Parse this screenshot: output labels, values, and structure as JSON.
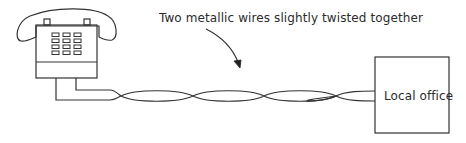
{
  "diagram": {
    "caption": "Two metallic wires slightly twisted together",
    "office_label": "Local office",
    "nodes": [
      {
        "id": "telephone",
        "icon": "telephone-icon"
      },
      {
        "id": "local-office",
        "label": "Local office"
      }
    ],
    "edges": [
      {
        "from": "telephone",
        "to": "local-office",
        "type": "twisted-pair",
        "label": "Two metallic wires slightly twisted together"
      }
    ],
    "colors": {
      "stroke": "#333333",
      "background": "#ffffff"
    }
  }
}
